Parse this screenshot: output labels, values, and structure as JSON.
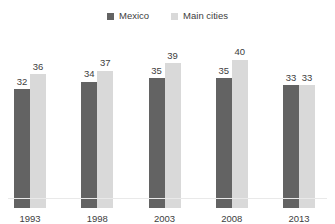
{
  "chart_data": {
    "type": "bar",
    "title": "",
    "categories": [
      "1993",
      "1998",
      "2003",
      "2008",
      "2013"
    ],
    "series": [
      {
        "name": "Mexico",
        "color": "#636363",
        "values": [
          32,
          34,
          35,
          35,
          33
        ]
      },
      {
        "name": "Main cities",
        "color": "#d9d9d9",
        "values": [
          36,
          37,
          39,
          40,
          33
        ]
      }
    ],
    "xlabel": "",
    "ylabel": "",
    "ylim": [
      0,
      42
    ],
    "grid": "off",
    "legend_position": "top-center",
    "data_labels": "above-bars",
    "label_color": "#404040"
  }
}
